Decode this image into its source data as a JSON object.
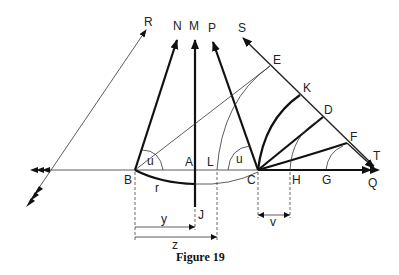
{
  "figure": {
    "caption": "Figure 19",
    "labels": {
      "R": "R",
      "N": "N",
      "M": "M",
      "P": "P",
      "S": "S",
      "E": "E",
      "K": "K",
      "D": "D",
      "F": "F",
      "T": "T",
      "B": "B",
      "A": "A",
      "L": "L",
      "C": "C",
      "H": "H",
      "G": "G",
      "Q": "Q",
      "J": "J",
      "u_left": "u",
      "u_right": "u",
      "r": "r",
      "y": "y",
      "z": "z",
      "v": "v"
    }
  }
}
